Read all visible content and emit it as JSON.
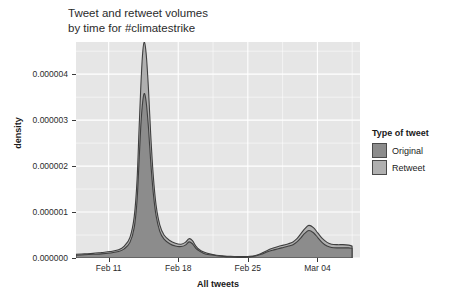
{
  "chart_data": {
    "type": "area",
    "title": "Tweet and retweet volumes\nby time for #climatestrike",
    "xlabel": "All tweets",
    "ylabel": "density",
    "legend_title": "Type of tweet",
    "legend_position": "right",
    "grid": true,
    "xlim": [
      "Feb 08",
      "Mar 08"
    ],
    "ylim": [
      0,
      4.7e-06
    ],
    "xtick_labels": [
      "Feb 11",
      "Feb 18",
      "Feb 25",
      "Mar 04"
    ],
    "xtick_positions": [
      0.115,
      0.36,
      0.605,
      0.85
    ],
    "ytick_labels": [
      "0.000000",
      "0.000001",
      "0.000002",
      "0.000003",
      "0.000004"
    ],
    "ytick_values": [
      0.0,
      1e-06,
      2e-06,
      3e-06,
      4e-06
    ],
    "panel_bg": "#e6e6e6",
    "grid_color": "#ffffff",
    "x": [
      0.0,
      0.03,
      0.06,
      0.09,
      0.12,
      0.15,
      0.17,
      0.19,
      0.205,
      0.215,
      0.222,
      0.228,
      0.234,
      0.24,
      0.247,
      0.255,
      0.263,
      0.272,
      0.282,
      0.295,
      0.31,
      0.33,
      0.35,
      0.37,
      0.385,
      0.398,
      0.41,
      0.422,
      0.435,
      0.45,
      0.47,
      0.495,
      0.52,
      0.545,
      0.57,
      0.592,
      0.612,
      0.632,
      0.652,
      0.672,
      0.692,
      0.712,
      0.73,
      0.748,
      0.764,
      0.778,
      0.792,
      0.806,
      0.82,
      0.836,
      0.852,
      0.868,
      0.884,
      0.9,
      0.92,
      0.94,
      0.96,
      0.972
    ],
    "series": [
      {
        "name": "Retweet",
        "color": "#b0b0b0",
        "note": "outer/upper envelope — total volume",
        "values": [
          0.08,
          0.09,
          0.1,
          0.12,
          0.14,
          0.18,
          0.26,
          0.45,
          0.9,
          1.7,
          2.8,
          3.7,
          4.4,
          4.7,
          4.45,
          3.7,
          2.7,
          1.8,
          1.15,
          0.72,
          0.5,
          0.38,
          0.32,
          0.3,
          0.34,
          0.42,
          0.38,
          0.26,
          0.18,
          0.13,
          0.09,
          0.06,
          0.045,
          0.035,
          0.03,
          0.03,
          0.035,
          0.055,
          0.1,
          0.16,
          0.21,
          0.25,
          0.28,
          0.31,
          0.35,
          0.42,
          0.53,
          0.64,
          0.71,
          0.66,
          0.54,
          0.42,
          0.34,
          0.3,
          0.29,
          0.29,
          0.28,
          0.26
        ]
      },
      {
        "name": "Original",
        "color": "#8c8c8c",
        "note": "inner/lower envelope — original tweets only",
        "values": [
          0.06,
          0.07,
          0.08,
          0.09,
          0.11,
          0.14,
          0.2,
          0.34,
          0.66,
          1.25,
          2.1,
          2.85,
          3.35,
          3.58,
          3.4,
          2.85,
          2.1,
          1.42,
          0.92,
          0.58,
          0.41,
          0.31,
          0.26,
          0.25,
          0.28,
          0.35,
          0.31,
          0.21,
          0.15,
          0.1,
          0.07,
          0.05,
          0.035,
          0.028,
          0.024,
          0.024,
          0.028,
          0.044,
          0.08,
          0.13,
          0.17,
          0.2,
          0.23,
          0.26,
          0.29,
          0.35,
          0.44,
          0.54,
          0.6,
          0.55,
          0.44,
          0.33,
          0.26,
          0.23,
          0.22,
          0.22,
          0.22,
          0.21
        ]
      }
    ],
    "legend_entries": [
      {
        "label": "Original",
        "color": "#8c8c8c"
      },
      {
        "label": "Retweet",
        "color": "#b0b0b0"
      }
    ]
  }
}
